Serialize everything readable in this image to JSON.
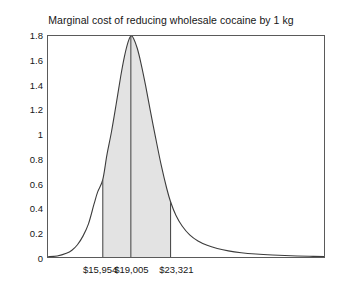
{
  "chart_data": {
    "type": "area",
    "title": "Marginal cost of reducing wholesale cocaine by 1 kg",
    "xlabel": "",
    "ylabel": "",
    "ylim": [
      0,
      1.8
    ],
    "xlim": [
      10000,
      40000
    ],
    "grid": false,
    "legend": null,
    "y_ticks": [
      "0",
      "0.2",
      "0.4",
      "0.6",
      "0.8",
      "1",
      "1.2",
      "1.4",
      "1.6",
      "1.8"
    ],
    "y_tick_values": [
      0,
      0.2,
      0.4,
      0.6,
      0.8,
      1,
      1.2,
      1.4,
      1.6,
      1.8
    ],
    "x_tick_labels": [
      "$15,954",
      "$19,005",
      "$23,321"
    ],
    "x_tick_values": [
      15954,
      19005,
      23321
    ],
    "annotations": {
      "lower_bound": "$15,954",
      "mode": "$19,005",
      "upper_bound": "$23,321"
    },
    "shaded_region": {
      "from": 15954,
      "to": 23321,
      "fill_color": "#e3e3e3",
      "edge_color": "#4d4d4d"
    },
    "curve_color": "#3c3c3c",
    "peak_value": 1.8,
    "peak_x": 19005,
    "x": [
      10000,
      11000,
      12000,
      12600,
      13200,
      13800,
      14400,
      15000,
      15400,
      15954,
      16400,
      16900,
      17400,
      17900,
      18300,
      18700,
      19005,
      19300,
      19700,
      20100,
      20600,
      21100,
      21700,
      22300,
      22900,
      23321,
      23900,
      24600,
      25400,
      26300,
      27300,
      28400,
      29600,
      31000,
      32600,
      34400,
      36400,
      38400,
      40000
    ],
    "y": [
      0.002,
      0.008,
      0.03,
      0.055,
      0.1,
      0.17,
      0.27,
      0.43,
      0.53,
      0.63,
      0.83,
      1.02,
      1.24,
      1.47,
      1.63,
      1.75,
      1.8,
      1.78,
      1.7,
      1.58,
      1.4,
      1.2,
      0.97,
      0.75,
      0.56,
      0.45,
      0.34,
      0.25,
      0.18,
      0.13,
      0.095,
      0.07,
      0.05,
      0.035,
      0.024,
      0.016,
      0.01,
      0.006,
      0.004
    ]
  },
  "figure": {
    "background": "#ffffff",
    "axis_color": "#5a5a5a"
  }
}
